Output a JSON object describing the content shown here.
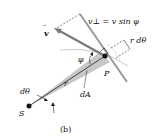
{
  "figure": {
    "caption": "(b)",
    "labels": {
      "v_perp": "v⊥ = v sin φ",
      "v_vec": "v",
      "r_dtheta": "r dθ",
      "phi": "φ",
      "P": "P",
      "dtheta": "dθ",
      "r": "r",
      "dA": "dA",
      "S": "S"
    },
    "colors": {
      "sector_fill": "#c8c8c8",
      "velocity_arrow": "#7a7a7a",
      "radial_line": "#9a9a9a",
      "ink": "#111111"
    }
  }
}
